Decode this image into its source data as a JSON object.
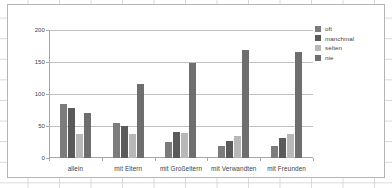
{
  "chart_data": {
    "type": "bar",
    "title": "",
    "xlabel": "",
    "ylabel": "",
    "ylim": [
      0,
      200
    ],
    "yticks": [
      0,
      50,
      100,
      150,
      200
    ],
    "grid": true,
    "legend_position": "right",
    "categories": [
      "allein",
      "mit Eltern",
      "mit Großeltern",
      "mit Verwandten",
      "mit Freunden"
    ],
    "series": [
      {
        "name": "oft",
        "color": "#7c7c7c",
        "values": [
          85,
          55,
          25,
          18,
          19
        ]
      },
      {
        "name": "manchmal",
        "color": "#5a5a5a",
        "values": [
          78,
          50,
          41,
          27,
          31
        ]
      },
      {
        "name": "selten",
        "color": "#b8b8b8",
        "values": [
          37,
          37,
          39,
          35,
          38
        ]
      },
      {
        "name": "nie",
        "color": "#6e6e6e",
        "values": [
          70,
          116,
          148,
          169,
          165
        ]
      }
    ]
  },
  "colors": {
    "plot_background": "#ffffff",
    "chart_border": "#b4b4b4",
    "gridline": "#bfbfbf",
    "axis": "#a6a6a6",
    "text": "#3f3f3f",
    "sheet_gridline": "#d9d9d9"
  }
}
